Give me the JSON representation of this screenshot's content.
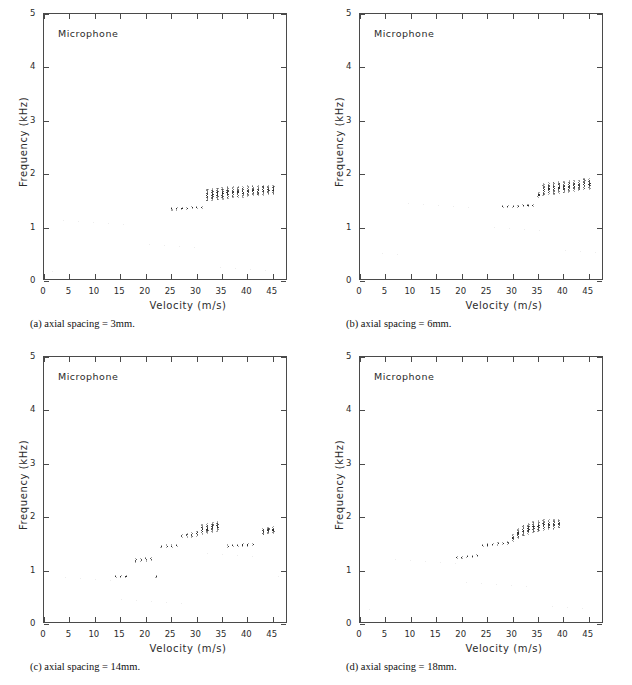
{
  "figure": {
    "series_label": "Microphone",
    "axis": {
      "xlabel": "Velocity (m/s)",
      "ylabel": "Frequency (kHz)",
      "xticks": [
        0,
        5,
        10,
        15,
        20,
        25,
        30,
        35,
        40,
        45
      ],
      "yticks": [
        0,
        1,
        2,
        3,
        4,
        5
      ],
      "xlim": [
        0,
        48
      ],
      "ylim": [
        0,
        5
      ]
    },
    "ink_color": "#262626",
    "axis_color": "#4a4a4a"
  },
  "panels": [
    {
      "id": "a",
      "caption": "(a) axial spacing = 3mm."
    },
    {
      "id": "b",
      "caption": "(b) axial spacing = 6mm."
    },
    {
      "id": "c",
      "caption": "(c) axial spacing = 14mm."
    },
    {
      "id": "d",
      "caption": "(d) axial spacing = 18mm."
    }
  ],
  "chart_data": [
    {
      "type": "scatter",
      "panel": "a",
      "title": "Microphone",
      "subtitle": "(a) axial spacing = 3mm.",
      "xlabel": "Velocity (m/s)",
      "ylabel": "Frequency (kHz)",
      "xlim": [
        0,
        48
      ],
      "ylim": [
        0,
        5
      ],
      "grid": false,
      "legend": null,
      "series": [
        {
          "name": "Microphone",
          "marker": "vertical-dot-column",
          "note": "Each x station is a narrow vertical spread of spectral peaks; value = band centre, spread = band half-height.",
          "x": [
            25.0,
            26.0,
            27.0,
            28.0,
            29.0,
            30.0,
            31.0,
            32.0,
            33.0,
            34.0,
            35.0,
            36.0,
            37.0,
            38.0,
            39.0,
            40.0,
            41.0,
            42.0,
            43.0,
            44.0,
            45.0
          ],
          "y": [
            1.36,
            1.36,
            1.37,
            1.37,
            1.38,
            1.38,
            1.39,
            1.62,
            1.63,
            1.64,
            1.65,
            1.66,
            1.67,
            1.67,
            1.68,
            1.69,
            1.7,
            1.7,
            1.71,
            1.72,
            1.72
          ],
          "spread": [
            0.02,
            0.02,
            0.02,
            0.02,
            0.02,
            0.02,
            0.02,
            0.11,
            0.11,
            0.11,
            0.11,
            0.11,
            0.1,
            0.1,
            0.1,
            0.1,
            0.09,
            0.09,
            0.09,
            0.08,
            0.08
          ]
        }
      ]
    },
    {
      "type": "scatter",
      "panel": "b",
      "title": "Microphone",
      "subtitle": "(b) axial spacing = 6mm.",
      "xlabel": "Velocity (m/s)",
      "ylabel": "Frequency (kHz)",
      "xlim": [
        0,
        48
      ],
      "ylim": [
        0,
        5
      ],
      "grid": false,
      "legend": null,
      "series": [
        {
          "name": "Microphone",
          "marker": "vertical-dot-column",
          "note": "Lower plateau near 1.4 kHz to 34 m/s, then a jump to a rising 1.7-1.85 kHz branch.",
          "x": [
            28.0,
            29.0,
            30.0,
            31.0,
            32.0,
            33.0,
            34.0,
            35.0,
            36.0,
            37.0,
            38.0,
            39.0,
            40.0,
            41.0,
            42.0,
            43.0,
            44.0,
            45.0
          ],
          "y": [
            1.4,
            1.4,
            1.41,
            1.41,
            1.42,
            1.42,
            1.43,
            1.62,
            1.72,
            1.74,
            1.75,
            1.76,
            1.77,
            1.78,
            1.79,
            1.8,
            1.82,
            1.83
          ],
          "spread": [
            0.02,
            0.02,
            0.02,
            0.02,
            0.02,
            0.02,
            0.02,
            0.05,
            0.11,
            0.11,
            0.11,
            0.11,
            0.11,
            0.11,
            0.1,
            0.1,
            0.1,
            0.1
          ]
        }
      ]
    },
    {
      "type": "scatter",
      "panel": "c",
      "title": "Microphone",
      "subtitle": "(c) axial spacing = 14mm.",
      "xlabel": "Velocity (m/s)",
      "ylabel": "Frequency (kHz)",
      "xlim": [
        0,
        48
      ],
      "ylim": [
        0,
        5
      ],
      "grid": false,
      "legend": null,
      "series": [
        {
          "name": "Microphone",
          "marker": "vertical-dot-column",
          "note": "Staircase of four stages: ~0.9 kHz, ~1.2 kHz, ~1.45 kHz, ~1.65-1.85 kHz, then a mode drop back to ~1.45 kHz at 36 m/s and a final jump to ~1.75 kHz at 43 m/s.",
          "x": [
            14.0,
            15.0,
            16.0,
            18.0,
            19.0,
            20.0,
            21.0,
            22.0,
            23.0,
            24.0,
            25.0,
            26.0,
            27.0,
            28.0,
            29.0,
            30.0,
            31.0,
            32.0,
            33.0,
            34.0,
            36.0,
            37.0,
            38.0,
            39.0,
            40.0,
            41.0,
            43.0,
            44.0,
            45.0
          ],
          "y": [
            0.9,
            0.9,
            0.9,
            1.2,
            1.21,
            1.22,
            1.23,
            0.9,
            1.46,
            1.47,
            1.47,
            1.48,
            1.66,
            1.67,
            1.68,
            1.7,
            1.78,
            1.8,
            1.82,
            1.84,
            1.47,
            1.48,
            1.48,
            1.49,
            1.49,
            1.5,
            1.74,
            1.76,
            1.77
          ],
          "spread": [
            0.02,
            0.02,
            0.02,
            0.03,
            0.03,
            0.03,
            0.03,
            0.02,
            0.02,
            0.02,
            0.02,
            0.02,
            0.03,
            0.03,
            0.04,
            0.05,
            0.09,
            0.09,
            0.09,
            0.09,
            0.02,
            0.02,
            0.02,
            0.02,
            0.02,
            0.02,
            0.06,
            0.06,
            0.06
          ]
        }
      ]
    },
    {
      "type": "scatter",
      "panel": "d",
      "title": "Microphone",
      "subtitle": "(d) axial spacing = 18mm.",
      "xlabel": "Velocity (m/s)",
      "ylabel": "Frequency (kHz)",
      "xlim": [
        0,
        48
      ],
      "ylim": [
        0,
        5
      ],
      "grid": false,
      "legend": null,
      "series": [
        {
          "name": "Microphone",
          "marker": "vertical-dot-column",
          "note": "Monotonic rising staircase from ~1.25 kHz at 19 m/s to ~1.9 kHz at 39 m/s, with broadening spread above 31 m/s.",
          "x": [
            19.0,
            20.0,
            21.0,
            22.0,
            23.0,
            24.0,
            25.0,
            26.0,
            27.0,
            28.0,
            29.0,
            30.0,
            31.0,
            32.0,
            33.0,
            34.0,
            35.0,
            36.0,
            37.0,
            38.0,
            39.0
          ],
          "y": [
            1.25,
            1.26,
            1.27,
            1.28,
            1.3,
            1.48,
            1.49,
            1.5,
            1.51,
            1.52,
            1.53,
            1.62,
            1.7,
            1.76,
            1.79,
            1.82,
            1.84,
            1.86,
            1.87,
            1.88,
            1.89
          ],
          "spread": [
            0.02,
            0.02,
            0.02,
            0.02,
            0.02,
            0.02,
            0.02,
            0.02,
            0.02,
            0.02,
            0.03,
            0.06,
            0.09,
            0.1,
            0.1,
            0.1,
            0.1,
            0.1,
            0.09,
            0.09,
            0.08
          ]
        }
      ]
    }
  ]
}
